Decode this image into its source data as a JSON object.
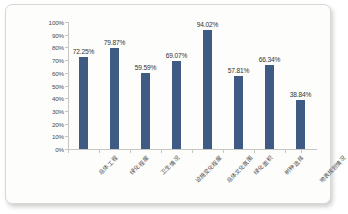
{
  "chart_data": {
    "type": "bar",
    "title": "",
    "subtitle": "",
    "xlabel": "",
    "ylabel": "",
    "categories": [
      "总体工程",
      "绿化程度",
      "卫生情况",
      "设施变化程度",
      "总体文化氛围",
      "绿化面积",
      "树种选择",
      "地表规划情况"
    ],
    "values": [
      72.25,
      79.87,
      59.59,
      69.07,
      94.02,
      57.81,
      66.34,
      38.84
    ],
    "value_labels": [
      "72.25%",
      "79.87%",
      "59.59%",
      "69.07%",
      "94.02%",
      "57.81%",
      "66.34%",
      "38.84%"
    ],
    "ylim": [
      0,
      100
    ],
    "ytick_values": [
      0,
      10,
      20,
      30,
      40,
      50,
      60,
      70,
      80,
      90,
      100
    ],
    "ytick_labels": [
      "0%",
      "10%",
      "20%",
      "30%",
      "40%",
      "50%",
      "60%",
      "70%",
      "80%",
      "90%",
      "100%"
    ],
    "grid": false,
    "legend": false,
    "legend_position": "none",
    "series": [
      {
        "name": "",
        "values": [
          72.25,
          79.87,
          59.59,
          69.07,
          94.02,
          57.81,
          66.34,
          38.84
        ]
      }
    ],
    "colors": {
      "bar": "#3F5A83",
      "axis": "#C6C6C2",
      "text": "#4A4A48",
      "value_text": "#333331",
      "background": "#FDFDFB",
      "frame_border": "#D8D8D4"
    }
  }
}
